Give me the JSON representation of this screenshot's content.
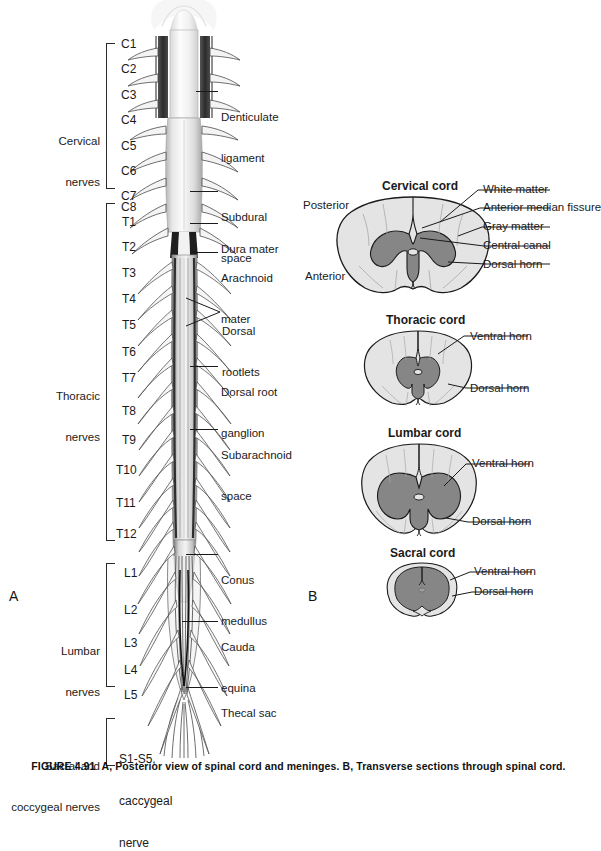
{
  "figure": {
    "caption_prefix": "FIGURE 4.91",
    "caption_text": "A, Posterior view of spinal cord and meninges. B, Transverse sections through spinal cord."
  },
  "panels": {
    "a": {
      "letter": "A",
      "title": "Posterior view of spinal cord and meninges"
    },
    "b": {
      "letter": "B",
      "title": "Transverse sections through spinal cord"
    }
  },
  "panel_a": {
    "groups": [
      {
        "name": "cervical",
        "label": "Cervical\nnerves",
        "label_line1": "Cervical",
        "label_line2": "nerves"
      },
      {
        "name": "thoracic",
        "label": "Thoracic\nnerves",
        "label_line1": "Thoracic",
        "label_line2": "nerves"
      },
      {
        "name": "lumbar",
        "label": "Lumbar\nnerves",
        "label_line1": "Lumbar",
        "label_line2": "nerves"
      },
      {
        "name": "sacral",
        "label": "Sacral and\ncoccygeal nerves",
        "label_line1": "Sacral and",
        "label_line2": "coccygeal nerves"
      }
    ],
    "cervical_segments": [
      "C1",
      "C2",
      "C3",
      "C4",
      "C5",
      "C6",
      "C7",
      "C8"
    ],
    "thoracic_segments": [
      "T1",
      "T2",
      "T3",
      "T4",
      "T5",
      "T6",
      "T7",
      "T8",
      "T9",
      "T10",
      "T11",
      "T12"
    ],
    "lumbar_segments": [
      "L1",
      "L2",
      "L3",
      "L4",
      "L5"
    ],
    "sacral_segment_lines": [
      "S1-S5,",
      "caccygeal",
      "nerve"
    ],
    "callouts": [
      {
        "name": "denticulate-ligament",
        "line1": "Denticulate",
        "line2": "ligament"
      },
      {
        "name": "subdural-space",
        "line1": "Subdural",
        "line2": "space"
      },
      {
        "name": "dura-mater",
        "line1": "Dura mater",
        "line2": ""
      },
      {
        "name": "arachnoid-mater",
        "line1": "Arachnoid",
        "line2": "mater"
      },
      {
        "name": "dorsal-rootlets",
        "line1": "Dorsal",
        "line2": "rootlets"
      },
      {
        "name": "dorsal-root-ganglion",
        "line1": "Dorsal root",
        "line2": "ganglion"
      },
      {
        "name": "subarachnoid-space",
        "line1": "Subarachnoid",
        "line2": "space"
      },
      {
        "name": "conus-medullus",
        "line1": "Conus",
        "line2": "medullus"
      },
      {
        "name": "cauda-equina",
        "line1": "Cauda",
        "line2": "equina"
      },
      {
        "name": "thecal-sac",
        "line1": "Thecal sac",
        "line2": ""
      }
    ]
  },
  "panel_b": {
    "sections": [
      {
        "name": "cervical-cord",
        "title": "Cervical cord",
        "orientation_labels": [
          "Posterior",
          "Anterior"
        ],
        "callouts": [
          "White matter",
          "Anterior median fissure",
          "Gray matter",
          "Central canal",
          "Dorsal horn"
        ]
      },
      {
        "name": "thoracic-cord",
        "title": "Thoracic cord",
        "orientation_labels": [],
        "callouts": [
          "Ventral horn",
          "Dorsal horn"
        ]
      },
      {
        "name": "lumbar-cord",
        "title": "Lumbar cord",
        "orientation_labels": [],
        "callouts": [
          "Ventral horn",
          "Dorsal horn"
        ]
      },
      {
        "name": "sacral-cord",
        "title": "Sacral cord",
        "orientation_labels": [],
        "callouts": [
          "Ventral horn",
          "Dorsal horn"
        ]
      }
    ]
  },
  "colors": {
    "white_matter": "#e4e4e4",
    "gray_matter": "#868686",
    "outline": "#1a1a1a",
    "cord_light": "#efefef",
    "cord_mid": "#b9b9b9",
    "cord_dark": "#3a3a3a",
    "background": "#ffffff"
  }
}
